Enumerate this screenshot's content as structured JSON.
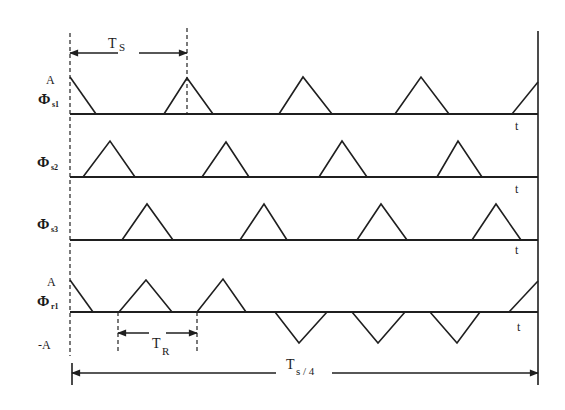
{
  "figure": {
    "colors": {
      "line": "#1f1f1f",
      "background": "#ffffff"
    },
    "x_start": 70,
    "x_end": 538,
    "right_frame": {
      "x": 538,
      "y1": 31,
      "y2": 385
    },
    "left_dashed": {
      "x": 70,
      "y1": 33,
      "y2": 356
    },
    "left_tick": {
      "x": 72,
      "y1": 363,
      "y2": 385
    },
    "waveforms": [
      {
        "id": "phi-s1",
        "symbol": "Φ",
        "subscript": "s1",
        "label_pos": [
          38,
          104
        ],
        "amp_label": "A",
        "amp_label_pos": [
          46,
          84
        ],
        "baseline_y": 114,
        "t_label": "t",
        "t_label_pos": [
          515,
          130
        ],
        "pulses": [
          [
            [
              70,
              77
            ],
            [
              96,
              114
            ]
          ],
          [
            [
              164,
              114
            ],
            [
              187,
              78
            ],
            [
              213,
              114
            ]
          ],
          [
            [
              279,
              114
            ],
            [
              303,
              77
            ],
            [
              332,
              114
            ]
          ],
          [
            [
              395,
              114
            ],
            [
              421,
              77
            ],
            [
              449,
              114
            ]
          ],
          [
            [
              512,
              114
            ],
            [
              538,
              82
            ]
          ]
        ]
      },
      {
        "id": "phi-s2",
        "symbol": "Φ",
        "subscript": "s2",
        "label_pos": [
          37,
          167
        ],
        "baseline_y": 177,
        "t_label": "t",
        "t_label_pos": [
          515,
          193
        ],
        "pulses": [
          [
            [
              83,
              177
            ],
            [
              110,
              141
            ],
            [
              135,
              177
            ]
          ],
          [
            [
              202,
              177
            ],
            [
              226,
              142
            ],
            [
              249,
              177
            ]
          ],
          [
            [
              319,
              177
            ],
            [
              342,
              141
            ],
            [
              367,
              177
            ]
          ],
          [
            [
              437,
              177
            ],
            [
              458,
              141
            ],
            [
              482,
              177
            ]
          ]
        ]
      },
      {
        "id": "phi-s3",
        "symbol": "Φ",
        "subscript": "s3",
        "label_pos": [
          37,
          229
        ],
        "baseline_y": 240,
        "t_label": "t",
        "t_label_pos": [
          515,
          254
        ],
        "pulses": [
          [
            [
              122,
              240
            ],
            [
              147,
              204
            ],
            [
              173,
              240
            ]
          ],
          [
            [
              240,
              240
            ],
            [
              264,
              204
            ],
            [
              287,
              240
            ]
          ],
          [
            [
              357,
              240
            ],
            [
              381,
              204
            ],
            [
              407,
              240
            ]
          ],
          [
            [
              472,
              240
            ],
            [
              496,
              204
            ],
            [
              521,
              240
            ]
          ]
        ]
      },
      {
        "id": "phi-r1",
        "symbol": "Φ",
        "subscript": "r1",
        "label_pos": [
          37,
          306
        ],
        "amp_label": "A",
        "amp_label_pos": [
          47,
          286
        ],
        "neg_amp_label": "-A",
        "neg_amp_label_pos": [
          38,
          349
        ],
        "baseline_y": 312,
        "t_label": "t",
        "t_label_pos": [
          517,
          331
        ],
        "pulses": [
          [
            [
              70,
              280
            ],
            [
              93,
              312
            ]
          ],
          [
            [
              119,
              312
            ],
            [
              146,
              280
            ],
            [
              172,
              312
            ]
          ],
          [
            [
              197,
              312
            ],
            [
              223,
              279
            ],
            [
              246,
              312
            ]
          ],
          [
            [
              275,
              312
            ],
            [
              299,
              343
            ],
            [
              327,
              312
            ]
          ],
          [
            [
              352,
              312
            ],
            [
              378,
              343
            ],
            [
              405,
              312
            ]
          ],
          [
            [
              430,
              312
            ],
            [
              457,
              343
            ],
            [
              480,
              312
            ]
          ],
          [
            [
              509,
              312
            ],
            [
              538,
              281
            ]
          ]
        ]
      }
    ],
    "dashed_markers": [
      {
        "id": "ts-right-marker",
        "x": 187,
        "y1": 28,
        "y2": 114
      },
      {
        "id": "tr-left-marker",
        "x": 118,
        "y1": 312,
        "y2": 353
      },
      {
        "id": "tr-right-marker",
        "x": 197,
        "y1": 312,
        "y2": 353
      }
    ],
    "dimensions": [
      {
        "id": "ts-dimension",
        "label": "T",
        "subscript": "S",
        "y": 53,
        "x1": 70,
        "x2": 187,
        "gap": [
          118,
          139
        ],
        "label_pos": [
          108,
          48
        ],
        "sub_pos": [
          119,
          51
        ]
      },
      {
        "id": "tr-dimension",
        "label": "T",
        "subscript": "R",
        "y": 333,
        "x1": 118,
        "x2": 197,
        "gap": [
          149,
          166
        ],
        "label_pos": [
          152,
          348
        ],
        "sub_pos": [
          162,
          355
        ]
      },
      {
        "id": "ts-quarter-dimension",
        "label": "T",
        "subscript": "s / 4",
        "y": 373,
        "x1": 72,
        "x2": 538,
        "gap": [
          276,
          332
        ],
        "label_pos": [
          286,
          369
        ],
        "sub_pos": [
          296,
          375
        ]
      }
    ]
  }
}
